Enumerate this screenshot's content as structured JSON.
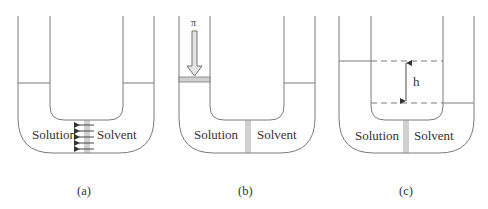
{
  "figure": {
    "colors": {
      "line": "#7a7a7a",
      "text": "#333333",
      "piston_fill": "#d0d0d0"
    },
    "panels": [
      {
        "id": "a",
        "caption": "(a)",
        "left_label": "Solution",
        "right_label": "Solvent",
        "feature": "solvent-flow-arrows"
      },
      {
        "id": "b",
        "caption": "(b)",
        "left_label": "Solution",
        "right_label": "Solvent",
        "pressure_symbol": "π",
        "feature": "piston-applied-pressure"
      },
      {
        "id": "c",
        "caption": "(c)",
        "left_label": "Solution",
        "right_label": "Solvent",
        "height_label": "h",
        "feature": "height-difference"
      }
    ]
  }
}
